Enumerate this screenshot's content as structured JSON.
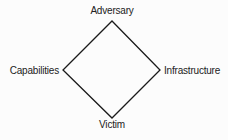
{
  "diagram": {
    "type": "diamond",
    "colors": {
      "background": "#fcfcfc",
      "stroke": "#1a1a1a",
      "text": "#222222"
    },
    "vertices": {
      "top": "Adversary",
      "left": "Capabilities",
      "right": "Infrastructure",
      "bottom": "Victim"
    },
    "edges": [
      [
        "Adversary",
        "Infrastructure"
      ],
      [
        "Infrastructure",
        "Victim"
      ],
      [
        "Victim",
        "Capabilities"
      ],
      [
        "Capabilities",
        "Adversary"
      ]
    ]
  }
}
